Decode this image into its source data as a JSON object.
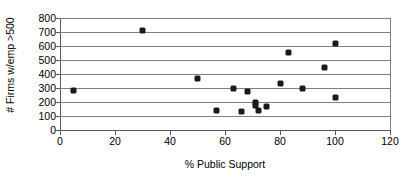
{
  "chart_data": {
    "type": "scatter",
    "title": "",
    "xlabel": "% Public Support",
    "ylabel": "# Firms w/emp >500",
    "xlim": [
      0,
      120
    ],
    "ylim": [
      0,
      800
    ],
    "xticks": [
      0,
      20,
      40,
      60,
      80,
      100,
      120
    ],
    "yticks": [
      0,
      100,
      200,
      300,
      400,
      500,
      600,
      700,
      800
    ],
    "grid": "horizontal",
    "legend": "none",
    "marker": "diamond",
    "marker_color": "#1a1a1a",
    "series": [
      {
        "name": "Firms vs Public Support",
        "points": [
          {
            "x": 5,
            "y": 280
          },
          {
            "x": 30,
            "y": 710
          },
          {
            "x": 50,
            "y": 365
          },
          {
            "x": 57,
            "y": 140
          },
          {
            "x": 63,
            "y": 297
          },
          {
            "x": 66,
            "y": 130
          },
          {
            "x": 68,
            "y": 273
          },
          {
            "x": 71,
            "y": 200
          },
          {
            "x": 71,
            "y": 175
          },
          {
            "x": 72,
            "y": 140
          },
          {
            "x": 75,
            "y": 168
          },
          {
            "x": 80,
            "y": 330
          },
          {
            "x": 83,
            "y": 553
          },
          {
            "x": 88,
            "y": 300
          },
          {
            "x": 96,
            "y": 445
          },
          {
            "x": 100,
            "y": 618
          },
          {
            "x": 100,
            "y": 235
          }
        ]
      }
    ]
  }
}
